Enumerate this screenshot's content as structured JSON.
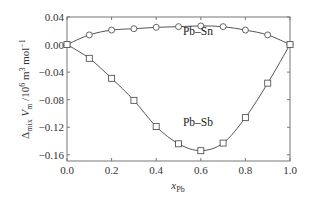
{
  "chart_data": {
    "type": "line",
    "title": "",
    "xlabel": "x_Pb",
    "xlabel_main": "x",
    "xlabel_sub": "Pb",
    "ylabel": "Δmix Vm /10^6 m^3 mol^-1",
    "ylabel_parts": {
      "delta": "Δ",
      "delta_sub": "mix",
      "v": " V",
      "v_sub": "m",
      "unit": " /10",
      "unit_sup": "6",
      "m": " m",
      "m_sup": "3",
      "mol": " mol",
      "mol_sup": "−1"
    },
    "xlim": [
      0.0,
      1.0
    ],
    "ylim": [
      -0.169,
      0.04
    ],
    "x_ticks": [
      0.0,
      0.2,
      0.4,
      0.6,
      0.8,
      1.0
    ],
    "x_tick_labels": [
      "0.0",
      "0.2",
      "0.4",
      "0.6",
      "0.8",
      "1.0"
    ],
    "y_ticks": [
      0.04,
      0.0,
      -0.04,
      -0.08,
      -0.12,
      -0.16
    ],
    "y_tick_labels": [
      "0.04",
      "0.00",
      "−0.04",
      "−0.08",
      "−0.12",
      "−0.16"
    ],
    "grid": false,
    "legend": "none (inline labels)",
    "series": [
      {
        "name": "Pb–Sn",
        "marker": "circle",
        "label_at": [
          0.52,
          0.0145
        ],
        "x": [
          0.0,
          0.1,
          0.2,
          0.3,
          0.4,
          0.5,
          0.6,
          0.7,
          0.8,
          0.9,
          1.0
        ],
        "values": [
          0.0,
          0.014,
          0.021,
          0.023,
          0.025,
          0.026,
          0.027,
          0.026,
          0.021,
          0.014,
          0.0
        ]
      },
      {
        "name": "Pb–Sb",
        "marker": "square",
        "label_at": [
          0.52,
          -0.118
        ],
        "x": [
          0.0,
          0.1,
          0.2,
          0.3,
          0.4,
          0.5,
          0.6,
          0.7,
          0.8,
          0.9,
          1.0
        ],
        "values": [
          0.0,
          -0.02,
          -0.049,
          -0.081,
          -0.119,
          -0.144,
          -0.154,
          -0.143,
          -0.106,
          -0.056,
          0.0
        ]
      }
    ]
  }
}
